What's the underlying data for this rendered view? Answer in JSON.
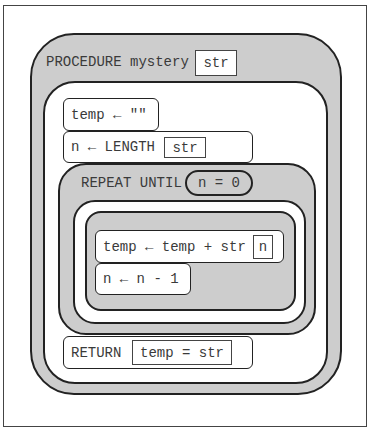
{
  "procedure": {
    "keyword": "PROCEDURE mystery",
    "parameter": "str"
  },
  "statements": {
    "init_temp": "temp ← \"\"",
    "assign_n_prefix": "n ← LENGTH",
    "assign_n_arg": "str",
    "repeat_keyword": "REPEAT UNTIL",
    "repeat_condition": "n = 0",
    "loop_concat_prefix": "temp ← temp + str",
    "loop_concat_index": "n",
    "loop_decrement": "n ← n - 1",
    "return_keyword": "RETURN",
    "return_expression": "temp = str"
  },
  "colors": {
    "block_fill": "#cdcdcd",
    "outline": "#222222",
    "text": "#3a3a3a"
  }
}
